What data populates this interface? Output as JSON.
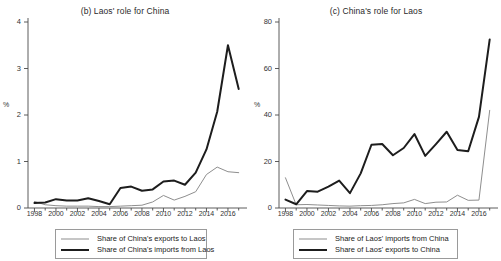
{
  "chart_data": [
    {
      "type": "line",
      "title": "(b) Laos' role for China",
      "xlabel": "",
      "ylabel": "%",
      "xlim": [
        1997.4,
        2017.4
      ],
      "ylim": [
        0,
        4
      ],
      "yticks": [
        0,
        1,
        2,
        3,
        4
      ],
      "ytick_labels": [
        "0",
        "1",
        "2",
        "3",
        "4"
      ],
      "xticks": [
        1998,
        2000,
        2002,
        2004,
        2006,
        2008,
        2010,
        2012,
        2014,
        2016
      ],
      "xtick_labels": [
        "1998",
        "2000",
        "2002",
        "2004",
        "2006",
        "2008",
        "2010",
        "2012",
        "2014",
        "2016"
      ],
      "grid": false,
      "legend_position": "below",
      "x": [
        1998,
        1999,
        2000,
        2001,
        2002,
        2003,
        2004,
        2005,
        2006,
        2007,
        2008,
        2009,
        2010,
        2011,
        2012,
        2013,
        2014,
        2015,
        2016,
        2017
      ],
      "series": [
        {
          "name": "Share of China's exports to Laos",
          "color": "#8e8e8e",
          "width": 1,
          "values": [
            0.14,
            0.07,
            0.05,
            0.04,
            0.04,
            0.04,
            0.03,
            0.03,
            0.04,
            0.05,
            0.06,
            0.13,
            0.27,
            0.17,
            0.25,
            0.35,
            0.72,
            0.88,
            0.78,
            0.76,
            0.36
          ]
        },
        {
          "name": "Share of China's imports from Laos",
          "color": "#1d1d1d",
          "width": 2,
          "values": [
            0.11,
            0.12,
            0.19,
            0.16,
            0.16,
            0.21,
            0.15,
            0.08,
            0.43,
            0.46,
            0.37,
            0.4,
            0.57,
            0.59,
            0.5,
            0.76,
            1.26,
            2.07,
            3.5,
            2.56
          ]
        }
      ],
      "legend": [
        {
          "label": "Share of China's exports to Laos",
          "style": "thin"
        },
        {
          "label": "Share of China's imports from Laos",
          "style": "thick"
        }
      ]
    },
    {
      "type": "line",
      "title": "(c) China's role for Laos",
      "xlabel": "",
      "ylabel": "%",
      "xlim": [
        1997.4,
        2017.4
      ],
      "ylim": [
        0,
        80
      ],
      "yticks": [
        0,
        20,
        40,
        60,
        80
      ],
      "ytick_labels": [
        "0",
        "20",
        "40",
        "60",
        "80"
      ],
      "xticks": [
        1998,
        2000,
        2002,
        2004,
        2006,
        2008,
        2010,
        2012,
        2014,
        2016
      ],
      "xtick_labels": [
        "1998",
        "2000",
        "2002",
        "2004",
        "2006",
        "2008",
        "2010",
        "2012",
        "2014",
        "2016"
      ],
      "grid": false,
      "legend_position": "below",
      "x": [
        1998,
        1999,
        2000,
        2001,
        2002,
        2003,
        2004,
        2005,
        2006,
        2007,
        2008,
        2009,
        2010,
        2011,
        2012,
        2013,
        2014,
        2015,
        2016,
        2017
      ],
      "series": [
        {
          "name": "Share of Laos' imports from China",
          "color": "#8e8e8e",
          "width": 1,
          "values": [
            13.0,
            1.4,
            1.5,
            1.3,
            1.1,
            0.9,
            0.8,
            1.0,
            1.1,
            1.4,
            1.9,
            2.2,
            3.7,
            1.9,
            2.5,
            2.6,
            5.5,
            3.3,
            3.4,
            42.0
          ]
        },
        {
          "name": "Share of Laos' exports to China",
          "color": "#1d1d1d",
          "width": 2,
          "values": [
            3.6,
            1.6,
            7.3,
            7.0,
            9.2,
            11.8,
            6.4,
            14.9,
            27.2,
            27.5,
            22.7,
            25.8,
            31.8,
            22.4,
            27.5,
            32.8,
            24.9,
            24.4,
            39.2,
            72.5
          ]
        }
      ],
      "legend": [
        {
          "label": "Share of Laos' imports from China",
          "style": "thin"
        },
        {
          "label": "Share of Laos' exports to China",
          "style": "thick"
        }
      ]
    }
  ]
}
